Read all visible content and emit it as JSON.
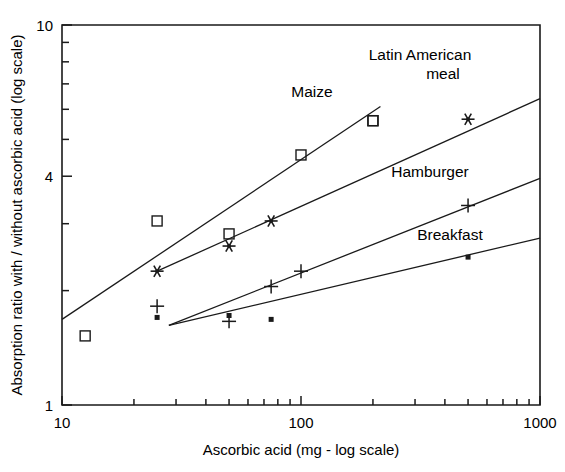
{
  "chart_data": {
    "type": "scatter",
    "title": "",
    "xlabel": "Ascorbic acid (mg - log scale)",
    "ylabel": "Absorption ratio with / without ascorbic acid (log scale)",
    "xscale": "log",
    "yscale": "log",
    "xlim": [
      10,
      1000
    ],
    "ylim": [
      1,
      10
    ],
    "grid": false,
    "legend_position": "inline-annotations",
    "xticks": [
      10,
      100,
      1000
    ],
    "xtick_labels": [
      "10",
      "100",
      "1000"
    ],
    "yticks": [
      1,
      4,
      10
    ],
    "ytick_labels": [
      "1",
      "4",
      "10"
    ],
    "x_minor_ticks": [
      20,
      30,
      40,
      50,
      60,
      70,
      80,
      90,
      200,
      300,
      400,
      500,
      600,
      700,
      800,
      900
    ],
    "y_minor_ticks": [
      2,
      3,
      5,
      6,
      7,
      8,
      9
    ],
    "series": [
      {
        "name": "Maize",
        "marker": "open-square",
        "label": "Maize",
        "points": [
          {
            "x": 12.5,
            "y": 1.52
          },
          {
            "x": 25,
            "y": 3.05
          },
          {
            "x": 50,
            "y": 2.82
          },
          {
            "x": 100,
            "y": 4.55
          },
          {
            "x": 200,
            "y": 5.6
          },
          {
            "x": 200,
            "y": 5.6
          }
        ],
        "trend": {
          "x1": 10,
          "y1": 1.68,
          "x2": 215,
          "y2": 6.1
        }
      },
      {
        "name": "Latin American meal",
        "marker": "asterisk",
        "label": "Latin American meal",
        "points": [
          {
            "x": 25,
            "y": 2.25
          },
          {
            "x": 50,
            "y": 2.62
          },
          {
            "x": 75,
            "y": 3.05
          },
          {
            "x": 500,
            "y": 5.65
          }
        ],
        "trend": {
          "x1": 25,
          "y1": 2.25,
          "x2": 1000,
          "y2": 6.4
        }
      },
      {
        "name": "Hamburger",
        "marker": "plus",
        "label": "Hamburger",
        "points": [
          {
            "x": 25,
            "y": 1.82
          },
          {
            "x": 50,
            "y": 1.66
          },
          {
            "x": 75,
            "y": 2.05
          },
          {
            "x": 100,
            "y": 2.25
          },
          {
            "x": 500,
            "y": 3.35
          }
        ],
        "trend": {
          "x1": 28,
          "y1": 1.62,
          "x2": 1000,
          "y2": 3.95
        }
      },
      {
        "name": "Breakfast",
        "marker": "filled-square",
        "label": "Breakfast",
        "points": [
          {
            "x": 25,
            "y": 1.7
          },
          {
            "x": 50,
            "y": 1.72
          },
          {
            "x": 75,
            "y": 1.68
          },
          {
            "x": 500,
            "y": 2.45
          }
        ],
        "trend": {
          "x1": 28,
          "y1": 1.62,
          "x2": 1000,
          "y2": 2.75
        }
      }
    ],
    "annotations": [
      {
        "text": "Maize",
        "x_px": 312,
        "y_px": 97
      },
      {
        "text": "Latin American",
        "x_px": 420,
        "y_px": 60
      },
      {
        "text": "meal",
        "x_px": 443,
        "y_px": 79
      },
      {
        "text": "Hamburger",
        "x_px": 430,
        "y_px": 177
      },
      {
        "text": "Breakfast",
        "x_px": 450,
        "y_px": 240
      }
    ]
  },
  "colors": {
    "ink": "#1a1a1a",
    "background": "#ffffff"
  }
}
